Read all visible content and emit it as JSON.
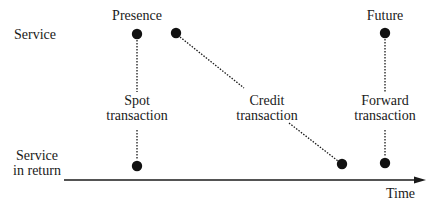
{
  "row_labels": {
    "service": "Service",
    "service_in_return_line1": "Service",
    "service_in_return_line2": "in return"
  },
  "column_labels": {
    "presence": "Presence",
    "future": "Future"
  },
  "transactions": [
    {
      "name": "spot",
      "line1": "Spot",
      "line2": "transaction"
    },
    {
      "name": "credit",
      "line1": "Credit",
      "line2": "transaction"
    },
    {
      "name": "forward",
      "line1": "Forward",
      "line2": "transaction"
    }
  ],
  "axis": {
    "label": "Time"
  },
  "colors": {
    "ink": "#1a1a1a",
    "background": "#ffffff"
  }
}
